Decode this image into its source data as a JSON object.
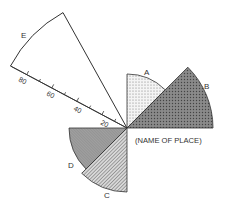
{
  "diagram": {
    "type": "wind-rose",
    "place_label": "(NAME OF PLACE)",
    "scale": {
      "tick_labels": [
        "20",
        "40",
        "60",
        "80"
      ],
      "units_max": 92
    },
    "sectors": [
      {
        "label": "A",
        "direction": "N to NE",
        "value": 38,
        "pattern": "light-stipple"
      },
      {
        "label": "B",
        "direction": "NE to E",
        "value": 60,
        "pattern": "dark-stipple"
      },
      {
        "label": "C",
        "direction": "S to SW",
        "value": 45,
        "pattern": "diagonal-hatch"
      },
      {
        "label": "D",
        "direction": "SW to W",
        "value": 41,
        "pattern": "cross-hatch-gray"
      },
      {
        "label": "E",
        "direction": "NW (narrow)",
        "value": 93,
        "pattern": "none"
      }
    ],
    "colors": {
      "line": "#333333",
      "fill_dark": "#7a7a7a",
      "fill_mid": "#a8a8a8",
      "fill_light": "#e8e8e8"
    }
  }
}
